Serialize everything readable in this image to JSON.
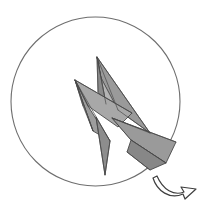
{
  "artwork": {
    "title": "Origami lightning bolt in circle with rotation arrow",
    "background_color": "#ffffff",
    "circle": {
      "name": "outline-circle",
      "center_x": 95.5,
      "center_y": 101.5,
      "radius": 84.5,
      "stroke_color": "#6e6e6e",
      "stroke_width": 1.1,
      "fill": "none"
    },
    "bolt": {
      "name": "origami-lightning-bolt",
      "stroke_color": "#3a3a3a",
      "stroke_width": 0.9,
      "fold_stroke_color": "#4a4a4a",
      "fold_stroke_width": 0.7,
      "tones": {
        "white": "#ffffff",
        "light": "#d2d2d2",
        "mid": "#a5a5a5",
        "medium": "#9a9a9a",
        "dark": "#8b8b8b",
        "darker": "#7e7e7e"
      },
      "key_points": {
        "top_tip": [
          97,
          57
        ],
        "left_wing_tip": [
          75,
          80
        ],
        "bottom_tip": [
          105,
          175
        ],
        "right_clip": [
          176,
          142
        ],
        "mid_notch": [
          112,
          118
        ]
      },
      "facets": [
        {
          "id": "upper-right-blade",
          "tone": "#9a9a9a",
          "points": "97,57 150,133 118,110 101,78"
        },
        {
          "id": "upper-blade-highlight",
          "tone": "#b4b4b4",
          "points": "97,57 101,78 118,110 106,104"
        },
        {
          "id": "upper-blade-shadow",
          "tone": "#8a8a8a",
          "points": "97,57 106,104 98,92"
        },
        {
          "id": "left-wing-upper",
          "tone": "#a8a8a8",
          "points": "75,80 132,113 118,127 88,106"
        },
        {
          "id": "left-wing-lower",
          "tone": "#9d9d9d",
          "points": "75,80 88,106 110,141 93,131"
        },
        {
          "id": "left-wing-crease",
          "tone": "#8e8e8e",
          "points": "75,80 93,131 83,106"
        },
        {
          "id": "lower-right-panel",
          "tone": "#9a9a9a",
          "points": "112,118 176,142 166,163 131,140"
        },
        {
          "id": "lower-right-panel-dark",
          "tone": "#878787",
          "points": "131,140 166,163 150,170 127,152"
        },
        {
          "id": "bottom-spike",
          "tone": "#8d8d8d",
          "points": "110,141 105,175 96,117"
        },
        {
          "id": "center-fold",
          "tone": "#b0b0b0",
          "points": "112,118 150,133 131,140"
        }
      ],
      "fold_lines": [
        "97,57 118,110",
        "97,57 106,104",
        "97,57 98,92",
        "97,57 150,133",
        "75,80 132,113",
        "75,80 88,106",
        "75,80 93,131",
        "75,80 83,106",
        "112,118 176,142",
        "112,118 150,133",
        "131,140 166,163",
        "110,141 105,175",
        "96,117 105,175",
        "118,110 150,133"
      ]
    },
    "rotation_arrow": {
      "name": "rotate-arrow",
      "stroke_color": "#3f3f3f",
      "stroke_width": 1.2,
      "fill_color": "#ffffff",
      "path": "M157,176 C163,190 174,196 184,192 L181,187 L196,189 L185,199 L183,194 C171,200 158,191 154,179 Z",
      "direction": "clockwise"
    }
  }
}
